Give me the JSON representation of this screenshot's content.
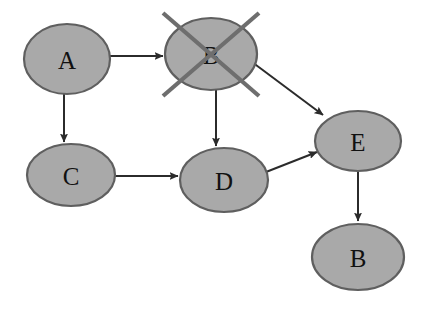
{
  "diagram": {
    "canvas": {
      "width": 422,
      "height": 309,
      "background": "#ffffff"
    },
    "style": {
      "node_fill": "#a9a9a9",
      "node_stroke": "#5f5f5f",
      "label_color": "#111111",
      "edge_color": "#2b2b2b",
      "cross_color": "#6e6e6e"
    },
    "nodes": [
      {
        "id": "a",
        "label": "A",
        "cx": 67,
        "cy": 59,
        "rx": 43,
        "ry": 35
      },
      {
        "id": "b1",
        "label": "B",
        "cx": 211,
        "cy": 54,
        "rx": 46,
        "ry": 36
      },
      {
        "id": "c",
        "label": "C",
        "cx": 71,
        "cy": 175,
        "rx": 44,
        "ry": 31
      },
      {
        "id": "d",
        "label": "D",
        "cx": 224,
        "cy": 180,
        "rx": 44,
        "ry": 32
      },
      {
        "id": "e",
        "label": "E",
        "cx": 358,
        "cy": 141,
        "rx": 43,
        "ry": 30
      },
      {
        "id": "b2",
        "label": "B",
        "cx": 358,
        "cy": 257,
        "rx": 46,
        "ry": 33
      }
    ],
    "edges": [
      {
        "id": "a-b",
        "from": "A",
        "to": "B",
        "x1": 110,
        "y1": 56,
        "x2": 163,
        "y2": 56
      },
      {
        "id": "a-c",
        "from": "A",
        "to": "C",
        "x1": 64,
        "y1": 93,
        "x2": 64,
        "y2": 142
      },
      {
        "id": "b-d",
        "from": "B",
        "to": "D",
        "x1": 216,
        "y1": 89,
        "x2": 216,
        "y2": 146
      },
      {
        "id": "b-e",
        "from": "B",
        "to": "E",
        "x1": 252,
        "y1": 62,
        "x2": 323,
        "y2": 115
      },
      {
        "id": "c-d",
        "from": "C",
        "to": "D",
        "x1": 115,
        "y1": 176,
        "x2": 178,
        "y2": 176
      },
      {
        "id": "d-e",
        "from": "D",
        "to": "E",
        "x1": 266,
        "y1": 172,
        "x2": 317,
        "y2": 152
      },
      {
        "id": "e-b2",
        "from": "E",
        "to": "B",
        "x1": 358,
        "y1": 171,
        "x2": 358,
        "y2": 221
      }
    ],
    "cross_mark": {
      "on_node": "B",
      "meaning": "crossed-out",
      "lines": [
        {
          "x1": 163,
          "y1": 13,
          "x2": 259,
          "y2": 96
        },
        {
          "x1": 259,
          "y1": 13,
          "x2": 163,
          "y2": 96
        }
      ]
    }
  }
}
